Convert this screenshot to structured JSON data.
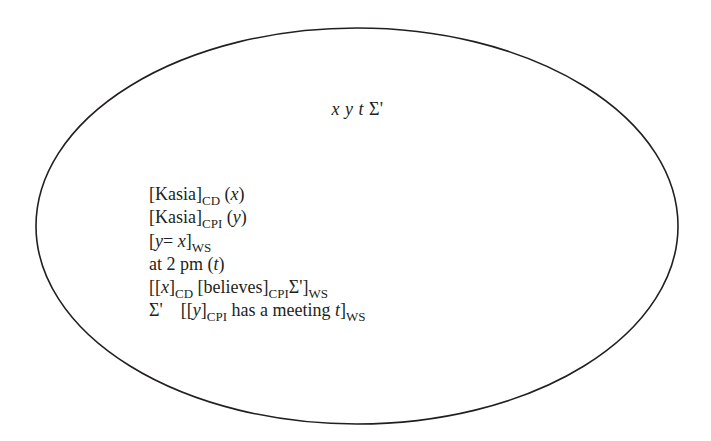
{
  "diagram": {
    "type": "discourse-representation-structure",
    "shape": "ellipse",
    "ellipse": {
      "cx": 357,
      "cy": 226,
      "rx": 321,
      "ry": 198,
      "stroke": "#231f20"
    },
    "header": {
      "referents": [
        "x",
        "y",
        "t",
        "Σ'"
      ],
      "text_x": "x",
      "text_y": "y",
      "text_t": "t",
      "text_sigma": "Σ'"
    },
    "conditions": [
      {
        "id": "c1",
        "parts": {
          "open": "[",
          "name": "Kasia",
          "close": "]",
          "sub": "CD",
          "pre": " (",
          "var": "x",
          "post": ")"
        }
      },
      {
        "id": "c2",
        "parts": {
          "open": "[",
          "name": "Kasia",
          "close": "]",
          "sub": "CPI",
          "pre": " (",
          "var": "y",
          "post": ")"
        }
      },
      {
        "id": "c3",
        "parts": {
          "open": "[",
          "var1": "y",
          "eq": "= ",
          "var2": "x",
          "close": "]",
          "sub": "WS"
        }
      },
      {
        "id": "c4",
        "parts": {
          "text": "at 2 pm (",
          "var": "t",
          "post": ")"
        }
      },
      {
        "id": "c5",
        "parts": {
          "open": "[[",
          "var": "x",
          "close1": "]",
          "sub1": "CD",
          "mid": " [believes]",
          "sub2": "CPI",
          "sigma": "Σ'",
          "close2": "]",
          "sub3": "WS"
        }
      },
      {
        "id": "c6",
        "parts": {
          "sigma": "Σ'",
          "open": "[[",
          "var": "y",
          "close1": "]",
          "sub1": "CPI",
          "mid": " has a meeting ",
          "var2": "t",
          "close2": "]",
          "sub2": "WS"
        }
      }
    ]
  }
}
